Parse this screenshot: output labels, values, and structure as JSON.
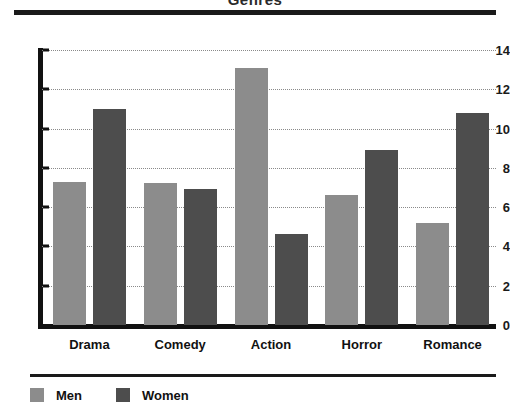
{
  "chart_data": {
    "type": "bar",
    "title": "Genres",
    "title_note": "cropped at top edge of image",
    "categories": [
      "Drama",
      "Comedy",
      "Action",
      "Horror",
      "Romance"
    ],
    "series": [
      {
        "name": "Men",
        "color": "#8c8c8c",
        "values": [
          7.3,
          7.25,
          13.1,
          6.6,
          5.2
        ]
      },
      {
        "name": "Women",
        "color": "#4d4d4d",
        "values": [
          11.0,
          6.9,
          4.65,
          8.9,
          10.8
        ]
      }
    ],
    "xlabel": "",
    "ylabel": "",
    "ylim": [
      0,
      14
    ],
    "yticks": [
      0,
      2,
      4,
      6,
      8,
      10,
      12,
      14
    ],
    "grid": true,
    "grid_style": "dotted-horizontal",
    "legend_position": "bottom-left"
  },
  "legend": {
    "items": [
      {
        "label": "Men"
      },
      {
        "label": "Women"
      }
    ]
  }
}
